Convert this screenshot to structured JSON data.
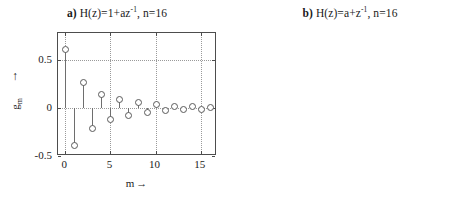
{
  "figure": {
    "background": "#ffffff",
    "axis_color": "#4d4d4d",
    "grid_color": "#9a9a9a",
    "stem_color": "#6e6e6e",
    "marker_edge_color": "#5a5a5a"
  },
  "panels": [
    {
      "tag": "a)",
      "title_text": "H(z)=1+az",
      "title_sup": "-1",
      "title_tail": ", n=16",
      "xlabel": "m",
      "xarrow": "→",
      "ylabel": "g",
      "ylabel_sub": "m",
      "yarrow": "↑",
      "xticks": [
        "0",
        "5",
        "10",
        "15"
      ],
      "xtick_values": [
        0,
        5,
        10,
        15
      ],
      "yticks": [
        "0.5",
        "0",
        "-0.5"
      ],
      "ytick_values": [
        0.5,
        0,
        -0.5
      ]
    },
    {
      "tag": "b)",
      "title_text": "H(z)=a+z",
      "title_sup": "-1",
      "title_tail": ", n=16",
      "xlabel": "m",
      "xarrow": "→",
      "ylabel": "g",
      "ylabel_sub": "m",
      "yarrow": "↑",
      "xticks": [
        "0",
        "5",
        "10",
        "15"
      ],
      "xtick_values": [
        0,
        5,
        10,
        15
      ],
      "yticks": [
        "1",
        "0.5",
        "0"
      ],
      "ytick_values": [
        1,
        0.5,
        0
      ]
    }
  ],
  "chart_data": [
    {
      "type": "scatter",
      "plot_style": "stem",
      "panel": "a",
      "title": "a) H(z)=1+az^-1, n=16",
      "xlabel": "m →",
      "ylabel": "g_m ↑",
      "xlim": [
        -0.8,
        16.8
      ],
      "ylim": [
        -0.5,
        0.78
      ],
      "xticks": [
        0,
        5,
        10,
        15
      ],
      "yticks": [
        -0.5,
        0,
        0.5
      ],
      "grid": true,
      "legend": null,
      "x": [
        0,
        1,
        2,
        3,
        4,
        5,
        6,
        7,
        8,
        9,
        10,
        11,
        12,
        13,
        14,
        15,
        16
      ],
      "values": [
        0.61,
        -0.39,
        0.27,
        -0.21,
        0.15,
        -0.12,
        0.09,
        -0.07,
        0.06,
        -0.04,
        0.04,
        -0.025,
        0.025,
        -0.015,
        0.017,
        -0.008,
        0.012
      ]
    },
    {
      "type": "scatter",
      "plot_style": "stem",
      "panel": "b",
      "title": "b) H(z)=a+z^-1, n=16",
      "xlabel": "m →",
      "ylabel": "g_m ↑",
      "xlim": [
        -0.8,
        16.8
      ],
      "ylim": [
        0,
        1.12
      ],
      "xticks": [
        0,
        5,
        10,
        15
      ],
      "yticks": [
        0,
        0.5,
        1
      ],
      "grid": true,
      "legend": null,
      "x": [
        0,
        1,
        2,
        3,
        4,
        5,
        6,
        7,
        8,
        9,
        10,
        11,
        12,
        13,
        14,
        15,
        16
      ],
      "values": [
        0,
        0,
        0,
        0,
        0,
        0,
        0,
        0,
        0,
        0,
        0,
        0,
        0,
        0,
        0,
        0,
        1.0
      ]
    }
  ]
}
